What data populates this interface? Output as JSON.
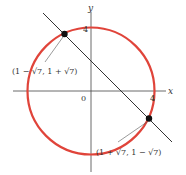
{
  "diagram": {
    "type": "graph-circle-line-intersection",
    "axes": {
      "x_label": "x",
      "y_label": "y",
      "origin_label": "0"
    },
    "ticks": {
      "x_tick": "4",
      "y_tick": "4"
    },
    "circle": {
      "equation": "x^2 + y^2 = 16",
      "radius": 4,
      "color": "#e0443a"
    },
    "line": {
      "equation": "x + y = 2",
      "color": "#333333"
    },
    "points": [
      {
        "label": "(1 − √7, 1 + √7)",
        "x": -1.6458,
        "y": 3.6458
      },
      {
        "label": "(1 + √7, 1 − √7)",
        "x": 3.6458,
        "y": -1.6458
      }
    ]
  }
}
